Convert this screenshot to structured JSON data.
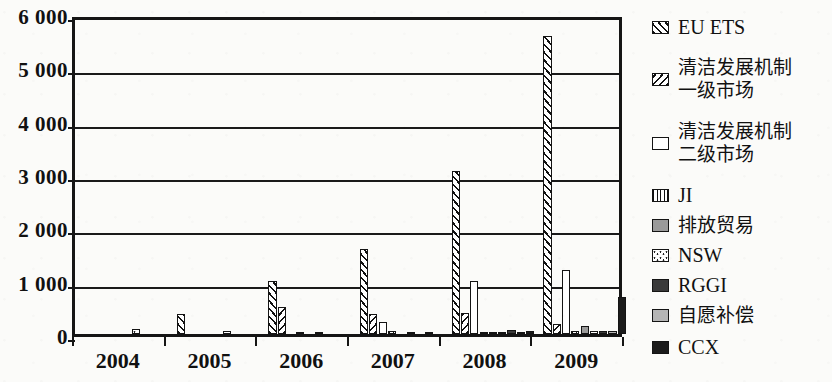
{
  "chart_data": {
    "type": "bar",
    "title": "",
    "subtitle": "",
    "xlabel": "",
    "ylabel": "",
    "ylim": [
      0,
      6000
    ],
    "ytick_values": [
      0,
      1000,
      2000,
      3000,
      4000,
      5000,
      6000
    ],
    "ytick_labels": [
      "0",
      "1 000",
      "2 000",
      "3 000",
      "4 000",
      "5 000",
      "6 000"
    ],
    "grid": true,
    "grid_axis": "y",
    "legend_position": "right",
    "categories": [
      "2004",
      "2005",
      "2006",
      "2007",
      "2008",
      "2009"
    ],
    "series": [
      {
        "name": "EU ETS",
        "pattern": "diagonal-hatch-right",
        "color": "#ffffff",
        "values": [
          0,
          370,
          1000,
          1600,
          3050,
          5580
        ]
      },
      {
        "name": "清洁发展机制\n一级市场",
        "pattern": "diagonal-hatch-left",
        "color": "#ffffff",
        "values": [
          0,
          0,
          500,
          380,
          390,
          180
        ]
      },
      {
        "name": "清洁发展机制\n二级市场",
        "pattern": "solid-white",
        "color": "#ffffff",
        "values": [
          0,
          0,
          0,
          230,
          1000,
          1200
        ]
      },
      {
        "name": "JI",
        "pattern": "vertical-hatch",
        "color": "#ffffff",
        "values": [
          0,
          0,
          30,
          60,
          40,
          50
        ]
      },
      {
        "name": "排放贸易",
        "pattern": "solid-mid-grey",
        "color": "#9a9a9a",
        "values": [
          0,
          0,
          0,
          0,
          40,
          150
        ]
      },
      {
        "name": "NSW",
        "pattern": "dotted",
        "color": "#ffffff",
        "values": [
          100,
          60,
          40,
          30,
          40,
          50
        ]
      },
      {
        "name": "RGGI",
        "pattern": "solid-dark-grey",
        "color": "#3a3a3a",
        "values": [
          0,
          0,
          0,
          0,
          70,
          50
        ]
      },
      {
        "name": "自愿补偿",
        "pattern": "solid-light-grey",
        "color": "#b5b5b5",
        "values": [
          0,
          0,
          0,
          30,
          30,
          50
        ]
      },
      {
        "name": "CCX",
        "pattern": "solid-black",
        "color": "#1b1b1b",
        "values": [
          0,
          0,
          0,
          0,
          60,
          700
        ]
      }
    ]
  },
  "axis": {
    "y": {
      "ticks": [
        {
          "value": 6000,
          "label": "6 000"
        },
        {
          "value": 5000,
          "label": "5 000"
        },
        {
          "value": 4000,
          "label": "4 000"
        },
        {
          "value": 3000,
          "label": "3 000"
        },
        {
          "value": 2000,
          "label": "2 000"
        },
        {
          "value": 1000,
          "label": "1 000"
        },
        {
          "value": 0,
          "label": "0"
        }
      ]
    },
    "x": {
      "ticks": [
        {
          "label": "2004"
        },
        {
          "label": "2005"
        },
        {
          "label": "2006"
        },
        {
          "label": "2007"
        },
        {
          "label": "2008"
        },
        {
          "label": "2009"
        }
      ]
    }
  },
  "legend": {
    "items": [
      {
        "label": "EU ETS",
        "swatch": "euets-swatch-icon",
        "cjk": false
      },
      {
        "label": "清洁发展机制\n一级市场",
        "swatch": "cdm-primary-swatch-icon",
        "cjk": true
      },
      {
        "label": "清洁发展机制\n二级市场",
        "swatch": "cdm-secondary-swatch-icon",
        "cjk": true
      },
      {
        "label": "JI",
        "swatch": "ji-swatch-icon",
        "cjk": false
      },
      {
        "label": "排放贸易",
        "swatch": "emissions-trading-swatch-icon",
        "cjk": true
      },
      {
        "label": "NSW",
        "swatch": "nsw-swatch-icon",
        "cjk": false
      },
      {
        "label": "RGGI",
        "swatch": "rggi-swatch-icon",
        "cjk": false
      },
      {
        "label": "自愿补偿",
        "swatch": "voluntary-offset-swatch-icon",
        "cjk": true
      },
      {
        "label": "CCX",
        "swatch": "ccx-swatch-icon",
        "cjk": false
      }
    ]
  }
}
